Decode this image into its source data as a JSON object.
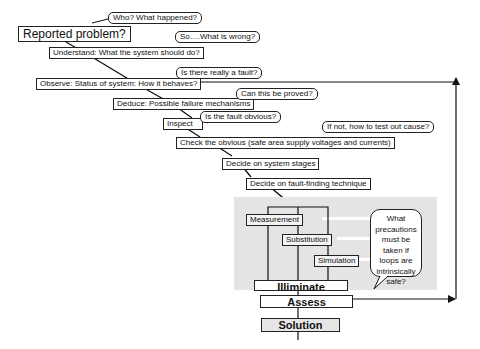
{
  "title_node": "Reported problem?",
  "steps": [
    {
      "id": "understand",
      "label": "Understand: What the system should do?"
    },
    {
      "id": "observe",
      "label": "Observe: Status of system: How  it behaves?"
    },
    {
      "id": "deduce",
      "label": "Deduce: Possible failure mechanisms"
    },
    {
      "id": "inspect",
      "label": "Inspect"
    },
    {
      "id": "check",
      "label": "Check the obvious (safe area supply voltages and currents)"
    },
    {
      "id": "stages",
      "label": "Decide on system stages"
    },
    {
      "id": "technique",
      "label": "Decide on fault-finding technique"
    }
  ],
  "questions": [
    {
      "id": "who",
      "label": "Who? What happened?"
    },
    {
      "id": "so",
      "label": "So….What is wrong?"
    },
    {
      "id": "fault",
      "label": "Is there really a fault?"
    },
    {
      "id": "proved",
      "label": "Can this be proved?"
    },
    {
      "id": "obvious",
      "label": "Is the fault obvious?"
    },
    {
      "id": "ifnot",
      "label": "If not, how  to test out cause?"
    }
  ],
  "techniques": [
    {
      "id": "measurement",
      "label": "Measurement"
    },
    {
      "id": "substitution",
      "label": "Substitution"
    },
    {
      "id": "simulation",
      "label": "Simulation"
    }
  ],
  "precaution_note": "What precautions must be taken if loops are intrinsically safe?",
  "bottom": {
    "illiminate": "Illiminate",
    "assess": "Assess",
    "solution": "Solution"
  }
}
